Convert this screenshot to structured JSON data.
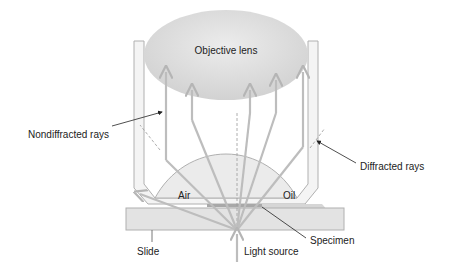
{
  "labels": {
    "objective_lens": "Objective lens",
    "nondiffracted_rays": "Nondiffracted rays",
    "diffracted_rays": "Diffracted rays",
    "air": "Air",
    "oil": "Oil",
    "slide": "Slide",
    "light_source": "Light source",
    "specimen": "Specimen"
  },
  "colors": {
    "lens_fill": "#dcdcdc",
    "housing_stroke": "#b0b0b0",
    "ray": "#bdbdbd",
    "oil_fill": "#d6d6d6",
    "slide_fill": "#e3e3e3"
  }
}
